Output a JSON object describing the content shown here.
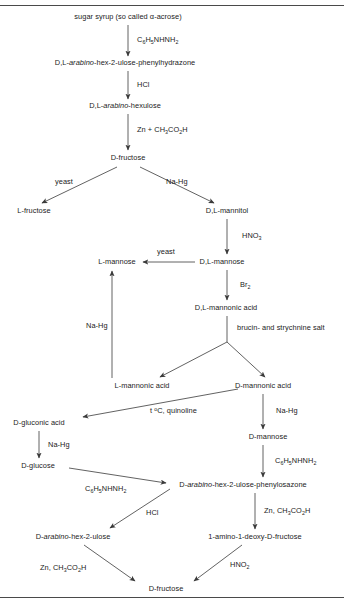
{
  "diagram": {
    "line_color": "#3a3a3a",
    "text_color": "#1b1b1b",
    "background": "#ffffff",
    "width": 344,
    "height": 607
  },
  "nodes": [
    {
      "id": "sugar-syrup",
      "text": "sugar syrup (so called α-acrose)",
      "x": 128,
      "y": 17
    },
    {
      "id": "dl-arabino-phenylhydrazone",
      "text": "D,L-arabino-hex-2-ulose-phenylhydrazone",
      "x": 125,
      "y": 63,
      "italic": "arabino"
    },
    {
      "id": "dl-arabino-hexulose",
      "text": "D,L-arabino-hexulose",
      "x": 125,
      "y": 106,
      "italic": "arabino"
    },
    {
      "id": "d-fructose-top",
      "text": "D-fructose",
      "x": 128,
      "y": 158
    },
    {
      "id": "l-fructose",
      "text": "L-fructose",
      "x": 34,
      "y": 211
    },
    {
      "id": "dl-mannitol",
      "text": "D,L-mannitol",
      "x": 227,
      "y": 211
    },
    {
      "id": "l-mannose",
      "text": "L-mannose",
      "x": 117,
      "y": 262
    },
    {
      "id": "dl-mannose",
      "text": "D,L-mannose",
      "x": 222,
      "y": 262
    },
    {
      "id": "dl-mannonic-acid",
      "text": "D,L-mannonic acid",
      "x": 226,
      "y": 308
    },
    {
      "id": "l-mannonic-acid",
      "text": "L-mannonic acid",
      "x": 142,
      "y": 386
    },
    {
      "id": "d-mannonic-acid",
      "text": "D-mannonic acid",
      "x": 263,
      "y": 386
    },
    {
      "id": "d-gluconic-acid",
      "text": "D-gluconic acid",
      "x": 39,
      "y": 423
    },
    {
      "id": "d-glucose",
      "text": "D-glucose",
      "x": 38,
      "y": 466
    },
    {
      "id": "d-mannose",
      "text": "D-mannose",
      "x": 268,
      "y": 437
    },
    {
      "id": "d-arabino-phenylosazone",
      "text": "D-arabino-hex-2-ulose-phenylosazone",
      "x": 243,
      "y": 485,
      "italic": "arabino"
    },
    {
      "id": "d-arabino-hex-2-ulose",
      "text": "D-arabino-hex-2-ulose",
      "x": 73,
      "y": 537,
      "italic": "arabino"
    },
    {
      "id": "amino-deoxy-fructose",
      "text": "1-amino-1-deoxy-D-fructose",
      "x": 255,
      "y": 537
    },
    {
      "id": "d-fructose-bottom",
      "text": "D-fructose",
      "x": 166,
      "y": 589
    }
  ],
  "reagents": [
    {
      "id": "phenylhydrazine-1",
      "html": "C<sub>6</sub>H<sub>5</sub>NHNH<sub>2</sub>",
      "x": 137,
      "y": 40,
      "align": "left"
    },
    {
      "id": "hcl-1",
      "html": "HCl",
      "x": 137,
      "y": 85,
      "align": "left"
    },
    {
      "id": "zn-acoh-1",
      "html": "Zn + CH<sub>3</sub>CO<sub>2</sub>H",
      "x": 137,
      "y": 130,
      "align": "left"
    },
    {
      "id": "yeast-1",
      "html": "yeast",
      "x": 55,
      "y": 182,
      "align": "left"
    },
    {
      "id": "na-hg-1",
      "html": "Na-Hg",
      "x": 166,
      "y": 182,
      "align": "left"
    },
    {
      "id": "hno3",
      "html": "HNO<sub>3</sub>",
      "x": 242,
      "y": 236,
      "align": "left"
    },
    {
      "id": "yeast-2",
      "html": "yeast",
      "x": 166,
      "y": 252,
      "align": "center"
    },
    {
      "id": "br2",
      "html": "Br<sub>2</sub>",
      "x": 240,
      "y": 285,
      "align": "left"
    },
    {
      "id": "brucin-strychnine",
      "html": "brucin- and strychnine salt",
      "x": 237,
      "y": 328,
      "align": "left"
    },
    {
      "id": "na-hg-2",
      "html": "Na-Hg",
      "x": 86,
      "y": 326,
      "align": "left"
    },
    {
      "id": "t-quinoline",
      "html": "t <sup>o</sup>C, quinoline",
      "x": 150,
      "y": 411,
      "align": "left"
    },
    {
      "id": "na-hg-3",
      "html": "Na-Hg",
      "x": 276,
      "y": 411,
      "align": "left"
    },
    {
      "id": "na-hg-4",
      "html": "Na-Hg",
      "x": 48,
      "y": 445,
      "align": "left"
    },
    {
      "id": "phenylhydrazine-2",
      "html": "C<sub>6</sub>H<sub>5</sub>NHNH<sub>2</sub>",
      "x": 275,
      "y": 461,
      "align": "left"
    },
    {
      "id": "phenylhydrazine-3",
      "html": "C<sub>6</sub>H<sub>5</sub>NHNH<sub>2</sub>",
      "x": 85,
      "y": 489,
      "align": "left"
    },
    {
      "id": "zn-acoh-2",
      "html": "Zn, CH<sub>3</sub>CO<sub>2</sub>H",
      "x": 264,
      "y": 511,
      "align": "left"
    },
    {
      "id": "hcl-2",
      "html": "HCl",
      "x": 146,
      "y": 513,
      "align": "left"
    },
    {
      "id": "zn-acoh-3",
      "html": "Zn, CH<sub>3</sub>CO<sub>2</sub>H",
      "x": 40,
      "y": 568,
      "align": "left"
    },
    {
      "id": "hno2",
      "html": "HNO<sub>2</sub>",
      "x": 230,
      "y": 565,
      "align": "left"
    }
  ],
  "arrows": [
    {
      "id": "arrow-syrup-to-hydrazone",
      "x1": 128,
      "y1": 25,
      "x2": 128,
      "y2": 56
    },
    {
      "id": "arrow-hydrazone-to-hexulose",
      "x1": 128,
      "y1": 71,
      "x2": 128,
      "y2": 99
    },
    {
      "id": "arrow-hexulose-to-fructose",
      "x1": 128,
      "y1": 114,
      "x2": 128,
      "y2": 150
    },
    {
      "id": "arrow-fructose-to-lfructose",
      "x1": 117,
      "y1": 167,
      "x2": 42,
      "y2": 203
    },
    {
      "id": "arrow-fructose-to-mannitol",
      "x1": 140,
      "y1": 167,
      "x2": 214,
      "y2": 203
    },
    {
      "id": "arrow-mannitol-to-dlmannose",
      "x1": 227,
      "y1": 219,
      "x2": 227,
      "y2": 254
    },
    {
      "id": "arrow-dlmannose-to-lmannose",
      "x1": 195,
      "y1": 262,
      "x2": 143,
      "y2": 262
    },
    {
      "id": "arrow-dlmannose-to-mannonic",
      "x1": 227,
      "y1": 270,
      "x2": 227,
      "y2": 300
    },
    {
      "id": "arrow-mannonic-branch-stem",
      "x1": 227,
      "y1": 316,
      "x2": 227,
      "y2": 342,
      "head": false
    },
    {
      "id": "arrow-branch-to-lmannonic",
      "x1": 227,
      "y1": 342,
      "x2": 160,
      "y2": 377
    },
    {
      "id": "arrow-branch-to-dmannonic",
      "x1": 227,
      "y1": 342,
      "x2": 265,
      "y2": 377
    },
    {
      "id": "arrow-lmannonic-to-lmannose",
      "x1": 112,
      "y1": 378,
      "x2": 112,
      "y2": 271
    },
    {
      "id": "arrow-dmannonic-to-gluconic",
      "x1": 238,
      "y1": 389,
      "x2": 83,
      "y2": 417
    },
    {
      "id": "arrow-dmannonic-to-dmannose",
      "x1": 263,
      "y1": 394,
      "x2": 263,
      "y2": 429
    },
    {
      "id": "arrow-gluconic-to-glucose",
      "x1": 39,
      "y1": 431,
      "x2": 39,
      "y2": 458
    },
    {
      "id": "arrow-glucose-to-osazone",
      "x1": 69,
      "y1": 468,
      "x2": 166,
      "y2": 483
    },
    {
      "id": "arrow-dmannose-to-osazone",
      "x1": 263,
      "y1": 445,
      "x2": 263,
      "y2": 477
    },
    {
      "id": "arrow-osazone-to-hex2ulose",
      "x1": 170,
      "y1": 489,
      "x2": 110,
      "y2": 528
    },
    {
      "id": "arrow-osazone-to-aminodeoxy",
      "x1": 255,
      "y1": 493,
      "x2": 255,
      "y2": 529
    },
    {
      "id": "arrow-hex2ulose-to-fructose",
      "x1": 84,
      "y1": 545,
      "x2": 135,
      "y2": 581
    },
    {
      "id": "arrow-aminodeoxy-to-fructose",
      "x1": 242,
      "y1": 545,
      "x2": 194,
      "y2": 581
    }
  ],
  "rules": {
    "top_label": "top-divider",
    "bottom_label": "bottom-divider"
  }
}
